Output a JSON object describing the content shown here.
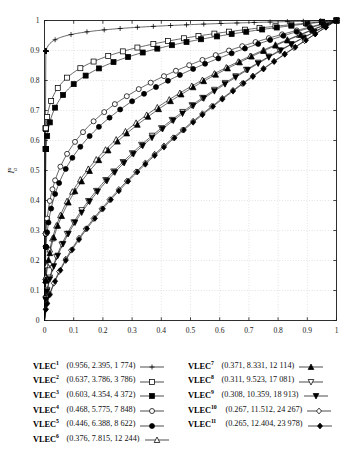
{
  "chart_data": {
    "type": "line",
    "title": "",
    "xlabel": "I_e^u",
    "ylabel": "I_a^u",
    "xlim": [
      0,
      1
    ],
    "ylim": [
      0,
      1
    ],
    "grid": true,
    "legend_position": "below",
    "x_ticks": [
      "0",
      "0.1",
      "0.2",
      "0.3",
      "0.4",
      "0.5",
      "0.6",
      "0.7",
      "0.8",
      "0.9",
      "1"
    ],
    "y_ticks": [
      "0",
      "0.1",
      "0.2",
      "0.3",
      "0.4",
      "0.5",
      "0.6",
      "0.7",
      "0.8",
      "0.9",
      "1"
    ],
    "series": [
      {
        "name": "VLEC",
        "superscript": "1",
        "values_text": "(0.956,  2.395,   1 774)",
        "gini": 0.956,
        "mean": 2.395,
        "count": 1774,
        "marker": "plus",
        "curvature": 0.042
      },
      {
        "name": "VLEC",
        "superscript": "2",
        "values_text": "(0.637,  3.786,   3 786)",
        "gini": 0.637,
        "mean": 3.786,
        "count": 3786,
        "marker": "open-square",
        "curvature": 0.33
      },
      {
        "name": "VLEC",
        "superscript": "3",
        "values_text": "(0.603,  4.354,   4 372)",
        "gini": 0.603,
        "mean": 4.354,
        "count": 4372,
        "marker": "filled-square",
        "curvature": 0.365
      },
      {
        "name": "VLEC",
        "superscript": "4",
        "values_text": "(0.468,  5.775,   7 848)",
        "gini": 0.468,
        "mean": 5.775,
        "count": 7848,
        "marker": "open-circle",
        "curvature": 0.52
      },
      {
        "name": "VLEC",
        "superscript": "5",
        "values_text": "(0.446,  6.388,   8 622)",
        "gini": 0.446,
        "mean": 6.388,
        "count": 8622,
        "marker": "filled-circle",
        "curvature": 0.55
      },
      {
        "name": "VLEC",
        "superscript": "6",
        "values_text": "(0.376,  7.815, 12 244)",
        "gini": 0.376,
        "mean": 7.815,
        "count": 12244,
        "marker": "open-triangle-up",
        "curvature": 0.635
      },
      {
        "name": "VLEC",
        "superscript": "7",
        "values_text": "(0.371,  8.331, 12 114)",
        "gini": 0.371,
        "mean": 8.331,
        "count": 12114,
        "marker": "filled-triangle-up",
        "curvature": 0.645
      },
      {
        "name": "VLEC",
        "superscript": "8",
        "values_text": "(0.311,  9.523, 17 081)",
        "gini": 0.311,
        "mean": 9.523,
        "count": 17081,
        "marker": "open-triangle-down",
        "curvature": 0.725
      },
      {
        "name": "VLEC",
        "superscript": "9",
        "values_text": "(0.308, 10.359, 18 913)",
        "gini": 0.308,
        "mean": 10.359,
        "count": 18913,
        "marker": "filled-triangle-down",
        "curvature": 0.732
      },
      {
        "name": "VLEC",
        "superscript": "10",
        "values_text": "(0.267, 11.512, 24 267)",
        "gini": 0.267,
        "mean": 11.512,
        "count": 24267,
        "marker": "open-diamond",
        "curvature": 0.8
      },
      {
        "name": "VLEC",
        "superscript": "11",
        "values_text": "(0.265, 12.404, 23 978)",
        "gini": 0.265,
        "mean": 12.404,
        "count": 23978,
        "marker": "filled-diamond",
        "curvature": 0.805
      }
    ]
  },
  "axes": {
    "x_label_main": "I",
    "x_label_sub": "e",
    "x_label_sup": "u",
    "y_label_main": "I",
    "y_label_sub": "a",
    "y_label_sup": "u"
  },
  "legend": {
    "left_column": [
      0,
      1,
      2,
      3,
      4,
      5
    ],
    "right_column": [
      6,
      7,
      8,
      9,
      10
    ]
  },
  "colors": {
    "line": "#000000",
    "grid": "#b9b9b9",
    "axis": "#1a1a1a",
    "background": "#ffffff"
  }
}
